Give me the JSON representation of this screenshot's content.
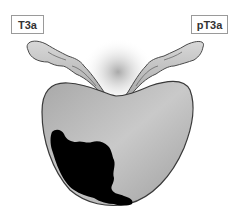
{
  "figure": {
    "labels": {
      "left": "T3a",
      "right": "pT3a"
    },
    "colors": {
      "gland_fill": "#b8b8b8",
      "gland_outline": "#3a3a3a",
      "tumor": "#000000",
      "vesicle_fill": "#c8c8c8",
      "label_border": "#9a9a9a"
    },
    "structures": [
      "left-seminal-vesicle",
      "right-seminal-vesicle",
      "prostate-gland",
      "tumor",
      "bladder-neck-shadow"
    ]
  }
}
